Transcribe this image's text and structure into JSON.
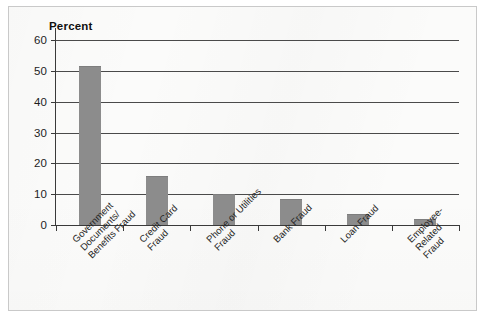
{
  "figure": {
    "background_color": "#fbfbfa",
    "border_color": "#c9c9c9"
  },
  "chart_data": {
    "type": "bar",
    "title": "",
    "subtitle": "",
    "xlabel": "",
    "ylabel": "Percent",
    "ylim": [
      0,
      60
    ],
    "ytick_values": [
      0,
      10,
      20,
      30,
      40,
      50,
      60
    ],
    "ytick_labels": [
      "0",
      "10",
      "20",
      "30",
      "40",
      "50",
      "60"
    ],
    "grid": true,
    "grid_axis": "y",
    "legend": false,
    "legend_position": "none",
    "bar_color": "#8c8c8c",
    "categories": [
      "Government Documents/ Benefits Fraud",
      "Credit Card Fraud",
      "Phone or Utilities Fraud",
      "Bank Fraud",
      "Loan Fraud",
      "Employee-Related Fraud"
    ],
    "category_label_lines": [
      [
        "Government",
        "Documents/",
        "Benefits Fraud"
      ],
      [
        "Credit Card",
        "Fraud"
      ],
      [
        "Phone or Utilities",
        "Fraud"
      ],
      [
        "Bank Fraud"
      ],
      [
        "Loan Fraud"
      ],
      [
        "Employee-",
        "Related",
        "Fraud"
      ]
    ],
    "values": [
      51.5,
      16,
      10,
      8.5,
      3.5,
      2
    ]
  }
}
